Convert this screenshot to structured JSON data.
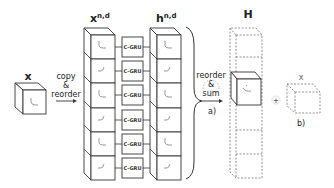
{
  "input": {
    "label": "x"
  },
  "step_copy": {
    "line1": "copy",
    "line2": "&",
    "line3": "reorder"
  },
  "stack_x": {
    "label": "x",
    "superscript": "n,d",
    "count": 6
  },
  "gru": {
    "labels": [
      "C-GRU",
      "C-GRU",
      "C-GRU",
      "C-GRU",
      "C-GRU",
      "C-GRU"
    ]
  },
  "stack_h": {
    "label": "h",
    "superscript": "n,d",
    "count": 6
  },
  "step_sum": {
    "line1": "reorder",
    "line2": "&",
    "line3": "sum",
    "tag": "a)"
  },
  "output": {
    "label": "H"
  },
  "residual": {
    "operator": "+",
    "label": "x",
    "tag": "b)"
  },
  "colors": {
    "line": "#333333",
    "dashed": "#777777",
    "background": "#ffffff"
  }
}
